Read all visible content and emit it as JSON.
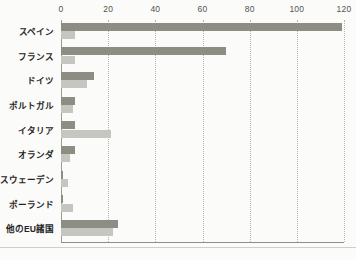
{
  "chart_data": {
    "type": "bar",
    "orientation": "horizontal",
    "title": "",
    "subtitle": "",
    "xlabel": "",
    "ylabel": "",
    "xlim": [
      0,
      120
    ],
    "ylim": null,
    "grid": "vertical-dotted",
    "legend": "none",
    "xticks": [
      0,
      20,
      40,
      60,
      80,
      100,
      120
    ],
    "xtick_labels": [
      "0",
      "20",
      "40",
      "60",
      "80",
      "100",
      "120"
    ],
    "categories": [
      "スペイン",
      "フランス",
      "ドイツ",
      "ポルトガル",
      "イタリア",
      "オランダ",
      "スウェーデン",
      "ポーランド",
      "他のEU諸国"
    ],
    "series": [
      {
        "name": "series-1",
        "color": "#8d8d83",
        "values": [
          119,
          70,
          14,
          6,
          6,
          6,
          1,
          1,
          24
        ]
      },
      {
        "name": "series-2",
        "color": "#c6c6c0",
        "values": [
          6,
          6,
          11,
          5,
          21,
          4,
          3,
          5,
          22
        ]
      }
    ]
  },
  "colors": {
    "series_dark": "#8d8d83",
    "series_light": "#c6c6c0",
    "gridline": "#b6b6ae",
    "axis": "#9b9b93",
    "text": "#24241f",
    "background": "#fbfbf9"
  }
}
